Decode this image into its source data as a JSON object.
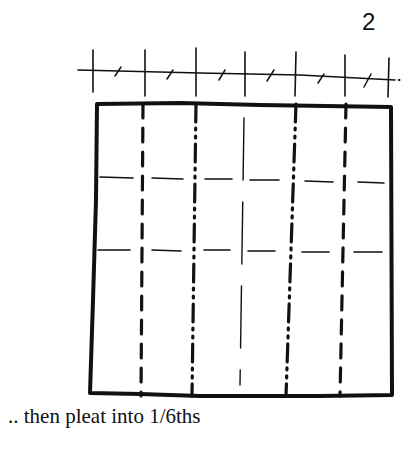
{
  "step": {
    "number": "2"
  },
  "caption": ".. then pleat into 1/6ths",
  "diagram": {
    "colors": {
      "ink": "#111111",
      "background": "#ffffff"
    },
    "ruler": {
      "y_left": 70,
      "y_right": 80,
      "x_start": 78,
      "x_end": 395,
      "major_ticks_x": [
        93,
        145,
        196,
        245,
        296,
        345,
        388
      ],
      "minor_ticks_x": [
        118,
        170,
        221,
        270,
        321,
        366
      ]
    },
    "square": {
      "left": 96,
      "top": 103,
      "right": 392,
      "bottom": 396
    },
    "vertical_folds": [
      {
        "x": 142,
        "style": "dashed",
        "type": "valley"
      },
      {
        "x": 196,
        "style": "dash-dot",
        "type": "mountain"
      },
      {
        "x": 241,
        "style": "thin-solid",
        "type": "crease"
      },
      {
        "x": 296,
        "style": "dash-dot",
        "type": "mountain"
      },
      {
        "x": 345,
        "style": "dashed",
        "type": "valley"
      }
    ],
    "horizontal_guides": [
      {
        "y": 180,
        "style": "dashed"
      },
      {
        "y": 250,
        "style": "dashed"
      }
    ]
  }
}
